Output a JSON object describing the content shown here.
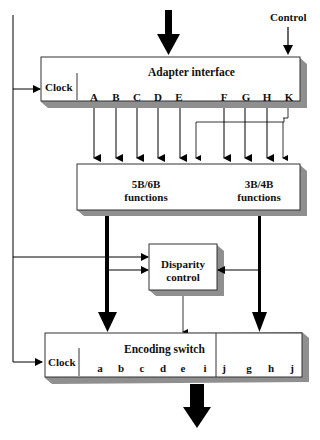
{
  "diagram": {
    "type": "8B/10B encoder block diagram",
    "top_control_label": "Control",
    "adapter": {
      "title": "Adapter interface",
      "clock_label": "Clock",
      "pins": [
        "A",
        "B",
        "C",
        "D",
        "E",
        "F",
        "G",
        "H",
        "K"
      ]
    },
    "functions": {
      "left_line1": "5B/6B",
      "left_line2": "functions",
      "right_line1": "3B/4B",
      "right_line2": "functions"
    },
    "disparity": {
      "line1": "Disparity",
      "line2": "control"
    },
    "encoding": {
      "title": "Encoding switch",
      "clock_label": "Clock",
      "pins": [
        "a",
        "b",
        "c",
        "d",
        "e",
        "i",
        "j",
        "g",
        "h",
        "j"
      ]
    },
    "colors": {
      "box_face": "#ffffff",
      "box_shadow": "#8f8f8f",
      "line": "#000000"
    }
  }
}
